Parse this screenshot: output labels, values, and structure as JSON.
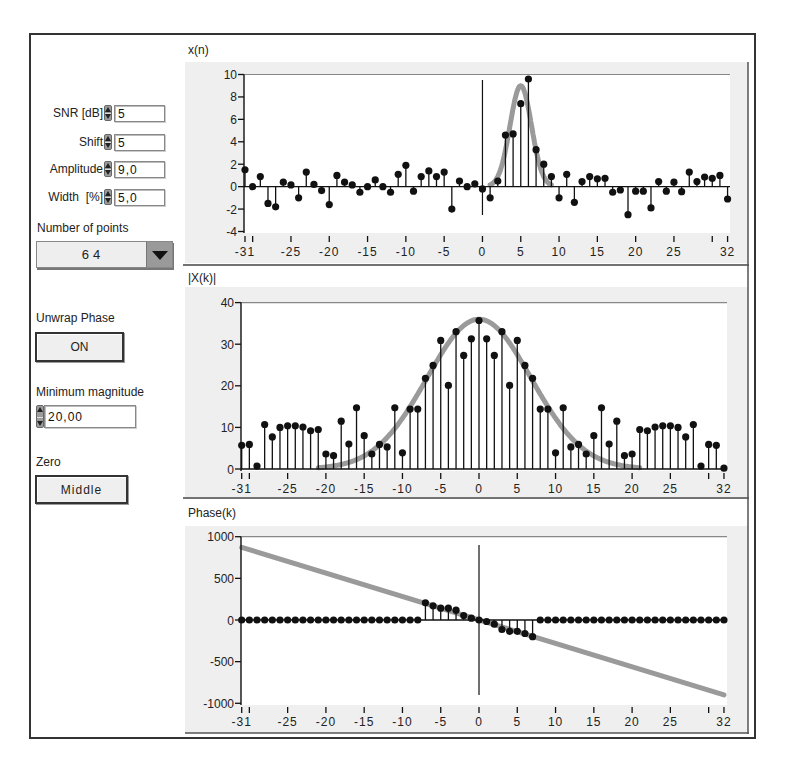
{
  "controls": {
    "snr": {
      "label": "SNR [dB]",
      "value": "5"
    },
    "shift": {
      "label": "Shift",
      "value": "5"
    },
    "amplitude": {
      "label": "Amplitude",
      "value": "9,0"
    },
    "width": {
      "label": "Width  [%]",
      "value": "5,0"
    },
    "number_of_points": {
      "label": "Number of points",
      "value": "64"
    },
    "unwrap_phase": {
      "label": "Unwrap Phase",
      "value": "ON"
    },
    "minimum_magnitude": {
      "label": "Minimum magnitude",
      "value": "20,00"
    },
    "zero": {
      "label": "Zero",
      "value": "Middle"
    }
  },
  "chart_data": [
    {
      "type": "stem",
      "title": "x(n)",
      "xlabel": "",
      "ylabel": "x(n)",
      "x_start": -31,
      "x_end": 32,
      "ylim": [
        -4,
        10
      ],
      "yticks": [
        10,
        8,
        6,
        4,
        2,
        0,
        -2,
        -4
      ],
      "xtick_marks": [
        -31,
        -30,
        -25,
        -20,
        -15,
        -10,
        -5,
        0,
        5,
        10,
        15,
        20,
        25,
        30,
        32
      ],
      "xtick_labels": [
        -31,
        -25,
        -20,
        -15,
        -10,
        -5,
        0,
        5,
        10,
        15,
        20,
        25,
        32
      ],
      "values": [
        1.5,
        0.0,
        0.9,
        -1.5,
        -1.8,
        0.4,
        0.15,
        -1.0,
        1.3,
        0.2,
        -0.35,
        -1.6,
        1.0,
        0.4,
        0.15,
        -0.5,
        0.0,
        0.6,
        0.0,
        -0.5,
        1.1,
        1.9,
        -0.4,
        0.9,
        1.4,
        0.9,
        1.3,
        -2.0,
        0.5,
        0.0,
        0.25,
        -0.2,
        -1.0,
        0.5,
        4.6,
        4.7,
        7.4,
        9.6,
        3.3,
        2.0,
        0.9,
        -1.0,
        1.1,
        -1.4,
        0.45,
        0.9,
        0.7,
        0.75,
        -0.5,
        -0.3,
        -2.5,
        -0.4,
        -0.4,
        -1.9,
        0.45,
        -0.4,
        0.4,
        -0.45,
        1.3,
        0.45,
        0.85,
        0.75,
        1.0,
        -1.1
      ],
      "overlay": {
        "type": "gaussian",
        "amplitude": 9,
        "center": 5,
        "sigma": 1.4,
        "min_visible": 0.15,
        "color": "#9a9a9a"
      },
      "vertical_marker_at": 0
    },
    {
      "type": "stem",
      "title": "|X(k)|",
      "xlabel": "",
      "ylabel": "|X(k)|",
      "x_start": -31,
      "x_end": 32,
      "ylim": [
        0,
        40
      ],
      "yticks": [
        40,
        30,
        20,
        10,
        0
      ],
      "xtick_marks": [
        -31,
        -30,
        -25,
        -20,
        -15,
        -10,
        -5,
        0,
        5,
        10,
        15,
        20,
        25,
        30,
        32
      ],
      "xtick_labels": [
        -31,
        -25,
        -20,
        -15,
        -10,
        -5,
        0,
        5,
        10,
        15,
        20,
        25,
        32
      ],
      "values": [
        5.7,
        5.9,
        0.7,
        10.7,
        7.7,
        10.0,
        10.4,
        10.4,
        10.1,
        9.2,
        9.5,
        3.6,
        3.2,
        11.5,
        6.0,
        14.7,
        8.0,
        3.6,
        5.9,
        5.3,
        14.7,
        3.9,
        14.4,
        14.4,
        21.8,
        24.9,
        30.9,
        20.1,
        33.0,
        27.3,
        31.3,
        35.7,
        31.3,
        27.3,
        33.0,
        20.1,
        30.9,
        24.9,
        21.8,
        14.4,
        14.4,
        3.9,
        14.7,
        5.3,
        5.9,
        3.6,
        8.0,
        14.7,
        6.0,
        11.5,
        3.2,
        3.6,
        9.5,
        9.2,
        10.1,
        10.4,
        10.4,
        10.0,
        7.7,
        10.7,
        0.7,
        5.9,
        5.7,
        0.2
      ],
      "overlay": {
        "type": "gaussian",
        "amplitude": 36,
        "center": 0,
        "sigma": 6.8,
        "min_visible": 0.3,
        "color": "#9a9a9a"
      },
      "vertical_marker_at": null
    },
    {
      "type": "stem",
      "title": "Phase(k)",
      "xlabel": "",
      "ylabel": "Phase(k)",
      "x_start": -31,
      "x_end": 32,
      "ylim": [
        -1000,
        1000
      ],
      "yticks": [
        1000,
        500,
        0,
        -500,
        -1000
      ],
      "xtick_marks": [
        -31,
        -30,
        -25,
        -20,
        -15,
        -10,
        -5,
        0,
        5,
        10,
        15,
        20,
        25,
        30,
        32
      ],
      "xtick_labels": [
        -31,
        -25,
        -20,
        -15,
        -10,
        -5,
        0,
        5,
        10,
        15,
        20,
        25,
        32
      ],
      "values": [
        0,
        0,
        0,
        0,
        0,
        0,
        0,
        0,
        0,
        0,
        0,
        0,
        0,
        0,
        0,
        0,
        0,
        0,
        0,
        0,
        0,
        0,
        0,
        0,
        206,
        170,
        142,
        142,
        118,
        54,
        22,
        0,
        -18,
        -50,
        -114,
        -136,
        -136,
        -162,
        -200,
        0,
        0,
        0,
        0,
        0,
        0,
        0,
        0,
        0,
        0,
        0,
        0,
        0,
        0,
        0,
        0,
        0,
        0,
        0,
        0,
        0,
        0,
        0,
        0,
        0
      ],
      "overlay": {
        "type": "line",
        "from": [
          -31,
          872
        ],
        "to": [
          32,
          -900
        ],
        "color": "#9a9a9a"
      },
      "vertical_marker_at": 0
    }
  ]
}
